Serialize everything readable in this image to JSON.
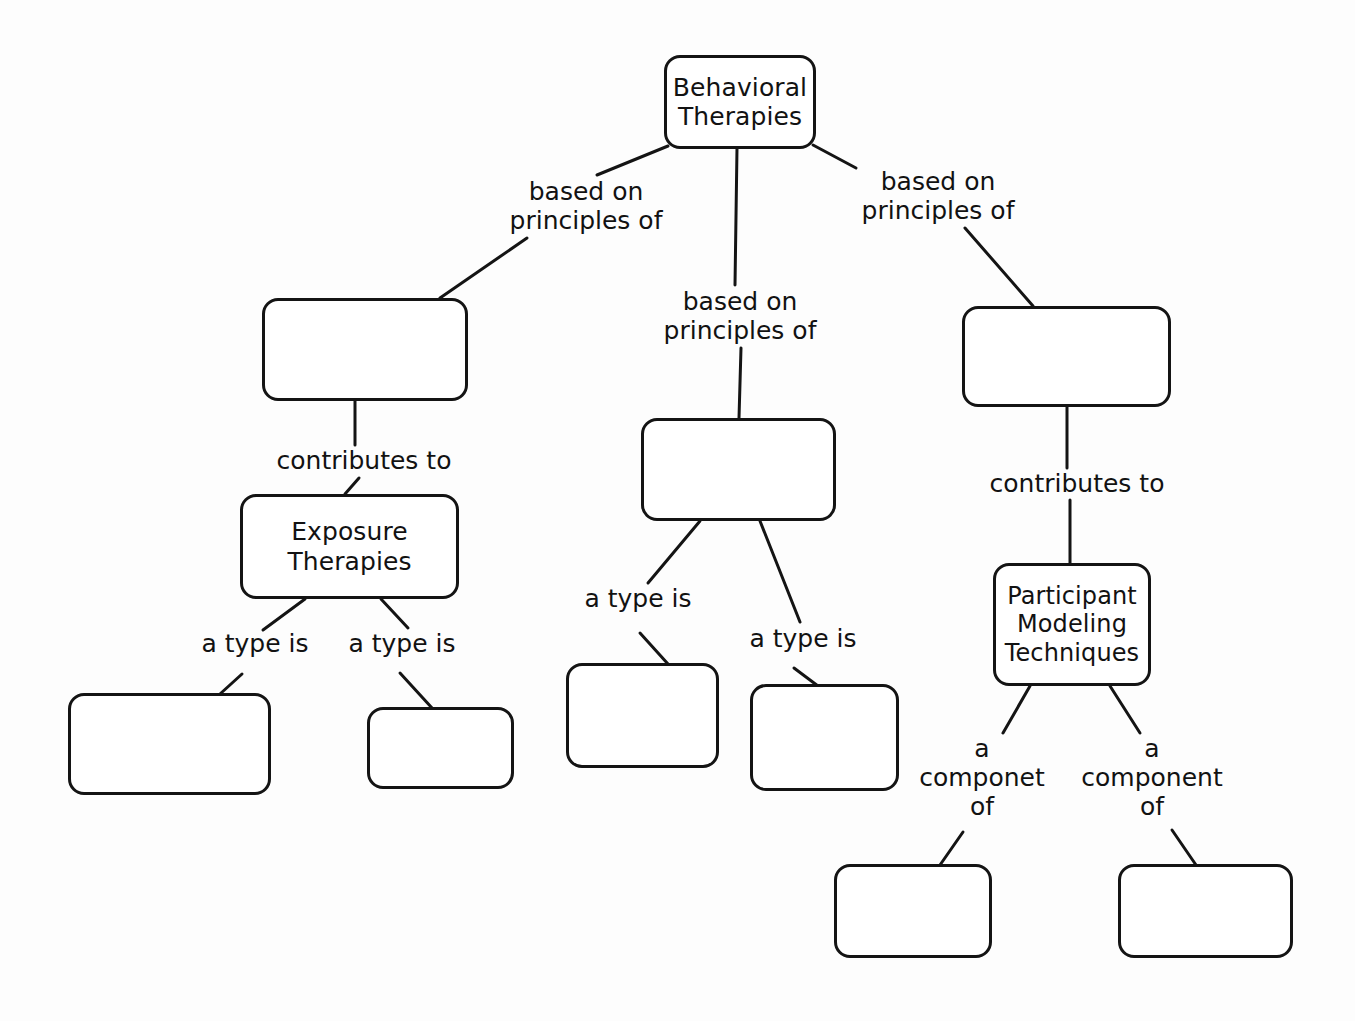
{
  "diagram": {
    "type": "concept-map",
    "stroke_color": "#141414",
    "text_color": "#121212",
    "background_color": "#fdfdfd",
    "nodes": [
      {
        "id": "root",
        "label": "Behavioral\nTherapies",
        "empty": false,
        "x": 664,
        "y": 55,
        "w": 152,
        "h": 94,
        "font_size": 25
      },
      {
        "id": "left-top",
        "label": "",
        "empty": true,
        "x": 262,
        "y": 298,
        "w": 206,
        "h": 103,
        "font_size": 25
      },
      {
        "id": "center-top",
        "label": "",
        "empty": true,
        "x": 641,
        "y": 418,
        "w": 195,
        "h": 103,
        "font_size": 25
      },
      {
        "id": "right-top",
        "label": "",
        "empty": true,
        "x": 962,
        "y": 306,
        "w": 209,
        "h": 101,
        "font_size": 25
      },
      {
        "id": "exposure",
        "label": "Exposure\nTherapies",
        "empty": false,
        "x": 240,
        "y": 494,
        "w": 219,
        "h": 105,
        "font_size": 25
      },
      {
        "id": "participant",
        "label": "Participant\nModeling\nTechniques",
        "empty": false,
        "x": 993,
        "y": 563,
        "w": 158,
        "h": 123,
        "font_size": 24
      },
      {
        "id": "left-leaf-1",
        "label": "",
        "empty": true,
        "x": 68,
        "y": 693,
        "w": 203,
        "h": 102,
        "font_size": 25
      },
      {
        "id": "left-leaf-2",
        "label": "",
        "empty": true,
        "x": 367,
        "y": 707,
        "w": 147,
        "h": 82,
        "font_size": 25
      },
      {
        "id": "center-leaf-1",
        "label": "",
        "empty": true,
        "x": 566,
        "y": 663,
        "w": 153,
        "h": 105,
        "font_size": 25
      },
      {
        "id": "center-leaf-2",
        "label": "",
        "empty": true,
        "x": 750,
        "y": 684,
        "w": 149,
        "h": 107,
        "font_size": 25
      },
      {
        "id": "right-leaf-1",
        "label": "",
        "empty": true,
        "x": 834,
        "y": 864,
        "w": 158,
        "h": 94,
        "font_size": 25
      },
      {
        "id": "right-leaf-2",
        "label": "",
        "empty": true,
        "x": 1118,
        "y": 864,
        "w": 175,
        "h": 94,
        "font_size": 25
      }
    ],
    "edge_labels": [
      {
        "id": "lbl-left-based",
        "text": "based on\nprinciples of",
        "x": 486,
        "y": 178,
        "w": 200
      },
      {
        "id": "lbl-center-based",
        "text": "based on\nprinciples of",
        "x": 640,
        "y": 288,
        "w": 200
      },
      {
        "id": "lbl-right-based",
        "text": "based on\nprinciples of",
        "x": 838,
        "y": 168,
        "w": 200
      },
      {
        "id": "lbl-left-contrib",
        "text": "contributes to",
        "x": 269,
        "y": 447,
        "w": 190
      },
      {
        "id": "lbl-right-contrib",
        "text": "contributes to",
        "x": 982,
        "y": 470,
        "w": 190
      },
      {
        "id": "lbl-type-1",
        "text": "a type is",
        "x": 190,
        "y": 630,
        "w": 130
      },
      {
        "id": "lbl-type-2",
        "text": "a type is",
        "x": 337,
        "y": 630,
        "w": 130
      },
      {
        "id": "lbl-type-3",
        "text": "a type is",
        "x": 573,
        "y": 585,
        "w": 130
      },
      {
        "id": "lbl-type-4",
        "text": "a type is",
        "x": 738,
        "y": 625,
        "w": 130
      },
      {
        "id": "lbl-componet-of",
        "text": "a\ncomponet\nof",
        "x": 907,
        "y": 735,
        "w": 150
      },
      {
        "id": "lbl-component-of",
        "text": "a\ncomponent\nof",
        "x": 1072,
        "y": 735,
        "w": 160
      }
    ],
    "edges": [
      {
        "id": "e-root-left",
        "from": "root",
        "to": "lbl-left-based",
        "x1": 668,
        "y1": 146,
        "x2": 597,
        "y2": 175
      },
      {
        "id": "e-left-top",
        "from": "lbl-left-based",
        "to": "left-top",
        "x1": 527,
        "y1": 238,
        "x2": 440,
        "y2": 298
      },
      {
        "id": "e-root-center",
        "from": "root",
        "to": "lbl-center-based",
        "x1": 737,
        "y1": 148,
        "x2": 735,
        "y2": 285
      },
      {
        "id": "e-center-top",
        "from": "lbl-center-based",
        "to": "center-top",
        "x1": 741,
        "y1": 348,
        "x2": 739,
        "y2": 418
      },
      {
        "id": "e-root-right",
        "from": "root",
        "to": "lbl-right-based",
        "x1": 813,
        "y1": 145,
        "x2": 856,
        "y2": 168
      },
      {
        "id": "e-right-top",
        "from": "lbl-right-based",
        "to": "right-top",
        "x1": 965,
        "y1": 228,
        "x2": 1033,
        "y2": 306
      },
      {
        "id": "e-left-contrib-a",
        "from": "left-top",
        "to": "lbl-left-contrib",
        "x1": 355,
        "y1": 401,
        "x2": 355,
        "y2": 445
      },
      {
        "id": "e-left-contrib-b",
        "from": "lbl-left-contrib",
        "to": "exposure",
        "x1": 359,
        "y1": 478,
        "x2": 345,
        "y2": 494
      },
      {
        "id": "e-right-contrib-a",
        "from": "right-top",
        "to": "lbl-right-contrib",
        "x1": 1067,
        "y1": 407,
        "x2": 1067,
        "y2": 468
      },
      {
        "id": "e-right-contrib-b",
        "from": "lbl-right-contrib",
        "to": "participant",
        "x1": 1070,
        "y1": 500,
        "x2": 1070,
        "y2": 563
      },
      {
        "id": "e-exp-type1-a",
        "from": "exposure",
        "to": "lbl-type-1",
        "x1": 305,
        "y1": 599,
        "x2": 263,
        "y2": 630
      },
      {
        "id": "e-exp-type1-b",
        "from": "lbl-type-1",
        "to": "left-leaf-1",
        "x1": 242,
        "y1": 674,
        "x2": 220,
        "y2": 694
      },
      {
        "id": "e-exp-type2-a",
        "from": "exposure",
        "to": "lbl-type-2",
        "x1": 381,
        "y1": 599,
        "x2": 408,
        "y2": 628
      },
      {
        "id": "e-exp-type2-b",
        "from": "lbl-type-2",
        "to": "left-leaf-2",
        "x1": 400,
        "y1": 673,
        "x2": 432,
        "y2": 708
      },
      {
        "id": "e-ctr-type3-a",
        "from": "center-top",
        "to": "lbl-type-3",
        "x1": 700,
        "y1": 521,
        "x2": 648,
        "y2": 583
      },
      {
        "id": "e-ctr-type3-b",
        "from": "lbl-type-3",
        "to": "center-leaf-1",
        "x1": 640,
        "y1": 633,
        "x2": 668,
        "y2": 664
      },
      {
        "id": "e-ctr-type4-a",
        "from": "center-top",
        "to": "lbl-type-4",
        "x1": 760,
        "y1": 521,
        "x2": 800,
        "y2": 622
      },
      {
        "id": "e-ctr-type4-b",
        "from": "lbl-type-4",
        "to": "center-leaf-2",
        "x1": 794,
        "y1": 668,
        "x2": 818,
        "y2": 686
      },
      {
        "id": "e-part-comp1-a",
        "from": "participant",
        "to": "lbl-componet-of",
        "x1": 1030,
        "y1": 686,
        "x2": 1003,
        "y2": 733
      },
      {
        "id": "e-part-comp1-b",
        "from": "lbl-componet-of",
        "to": "right-leaf-1",
        "x1": 963,
        "y1": 832,
        "x2": 940,
        "y2": 865
      },
      {
        "id": "e-part-comp2-a",
        "from": "participant",
        "to": "lbl-component-of",
        "x1": 1110,
        "y1": 686,
        "x2": 1140,
        "y2": 733
      },
      {
        "id": "e-part-comp2-b",
        "from": "lbl-component-of",
        "to": "right-leaf-2",
        "x1": 1172,
        "y1": 830,
        "x2": 1196,
        "y2": 865
      }
    ]
  }
}
